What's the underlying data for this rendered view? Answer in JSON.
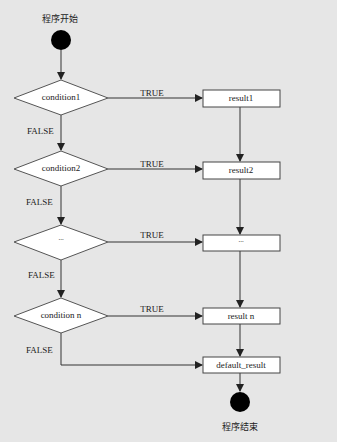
{
  "flowchart": {
    "start": {
      "label": "程序开始"
    },
    "end": {
      "label": "程序结束"
    },
    "conditions": [
      {
        "label": "condition1",
        "true_label": "TRUE",
        "false_label": "FALSE",
        "result": "result1"
      },
      {
        "label": "condition2",
        "true_label": "TRUE",
        "false_label": "FALSE",
        "result": "result2"
      },
      {
        "label": "...",
        "true_label": "TRUE",
        "false_label": "FALSE",
        "result": "..."
      },
      {
        "label": "condition n",
        "true_label": "TRUE",
        "false_label": "FALSE",
        "result": "result n"
      }
    ],
    "default": {
      "label": "default_result"
    },
    "colors": {
      "background": "#e6e6e6",
      "node_fill": "#ffffff",
      "stroke": "#333333",
      "terminal": "#000000"
    }
  }
}
